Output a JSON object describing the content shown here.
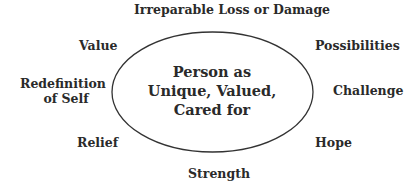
{
  "diagram": {
    "center": {
      "lines": [
        "Person as",
        "Unique, Valued,",
        "Cared for"
      ]
    },
    "labels": {
      "top": "Irreparable Loss or Damage",
      "upper_left": "Value",
      "upper_right": "Possibilities",
      "mid_left_line1": "Redefinition",
      "mid_left_line2": "of Self",
      "mid_right": "Challenge",
      "lower_left": "Relief",
      "lower_right": "Hope",
      "bottom": "Strength"
    },
    "colors": {
      "text": "#2a2a2a",
      "stroke": "#333333",
      "background": "#ffffff"
    }
  }
}
